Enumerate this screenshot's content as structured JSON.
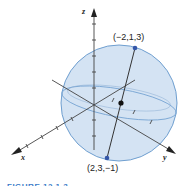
{
  "figure": {
    "axes": {
      "x_label": "x",
      "y_label": "y",
      "z_label": "z"
    },
    "points": {
      "top": "(−2,1,3)",
      "bottom": "(2,3,−1)"
    },
    "caption": "FIGURE 12.1.3"
  },
  "colors": {
    "sphere_fill": "#cfe0f1",
    "sphere_stroke": "#6f9fd0",
    "axis": "#333333",
    "point": "#3456a8",
    "center": "#111111",
    "caption": "#3a7bc8"
  }
}
